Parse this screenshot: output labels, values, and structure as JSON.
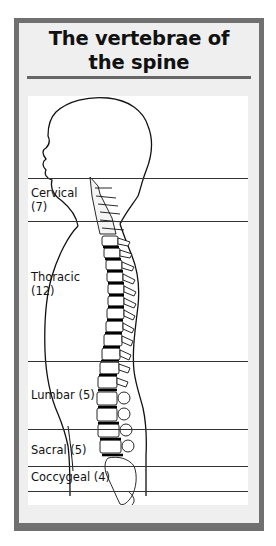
{
  "title": {
    "line1": "The vertebrae of",
    "line2": "the spine"
  },
  "regions": [
    {
      "name": "Cervical",
      "count": "(7)",
      "label_line1": "Cervical",
      "label_line2": "(7)"
    },
    {
      "name": "Thoracic",
      "count": "(12)",
      "label_line1": "Thoracic",
      "label_line2": "(12)"
    },
    {
      "name": "Lumbar",
      "count": "(5)",
      "label": "Lumbar (5)"
    },
    {
      "name": "Sacral",
      "count": "(5)",
      "label": "Sacral (5)"
    },
    {
      "name": "Coccygeal",
      "count": "(4)",
      "label": "Coccygeal (4)"
    }
  ],
  "colors": {
    "frame_border": "#707070",
    "frame_bg": "#efefef",
    "panel_bg": "#ffffff",
    "ink": "#111111"
  }
}
